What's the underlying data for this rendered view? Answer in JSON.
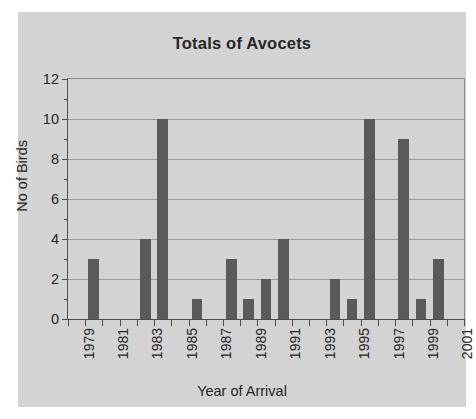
{
  "chart_data": {
    "type": "bar",
    "title": "Totals of Avocets",
    "xlabel": "Year of Arrival",
    "ylabel": "No of Birds",
    "ylim": [
      0,
      12
    ],
    "ytick_step": 2,
    "grid": true,
    "legend": "none",
    "background_color": "#d3d3d3",
    "bar_color": "#5a5a5a",
    "axis_color": "#4d4d4d",
    "text_color": "#262626",
    "x_tick_labels": [
      "1979",
      "1981",
      "1983",
      "1985",
      "1987",
      "1989",
      "1991",
      "1993",
      "1995",
      "1997",
      "1999",
      "2001"
    ],
    "y_tick_labels": [
      "0",
      "2",
      "4",
      "6",
      "8",
      "10",
      "12"
    ],
    "categories": [
      "1979",
      "1980",
      "1981",
      "1982",
      "1983",
      "1984",
      "1985",
      "1986",
      "1987",
      "1988",
      "1989",
      "1990",
      "1991",
      "1992",
      "1993",
      "1994",
      "1995",
      "1996",
      "1997",
      "1998",
      "1999",
      "2000",
      "2001"
    ],
    "values": [
      0,
      3,
      0,
      0,
      4,
      10,
      0,
      1,
      0,
      3,
      1,
      2,
      4,
      0,
      0,
      2,
      1,
      10,
      0,
      9,
      1,
      3,
      0
    ]
  }
}
